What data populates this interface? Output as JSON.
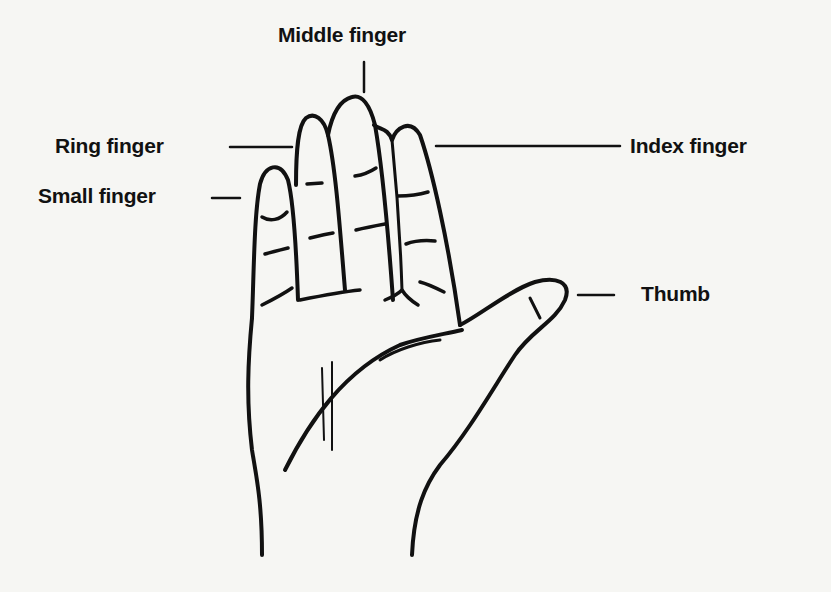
{
  "diagram": {
    "labels": {
      "middle": "Middle finger",
      "ring": "Ring finger",
      "index": "Index finger",
      "small": "Small finger",
      "thumb": "Thumb"
    },
    "colors": {
      "ink": "#111111",
      "paper": "#f6f6f3"
    }
  }
}
